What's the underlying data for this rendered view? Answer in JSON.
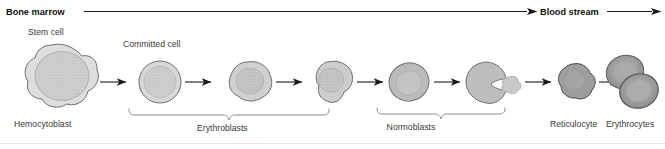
{
  "figure": {
    "title_hidden": "Erythropoiesis stages diagram",
    "header": {
      "left_label": "Bone marrow",
      "right_label": "Blood stream"
    },
    "callouts": {
      "stem_cell": "Stem cell",
      "committed_cell": "Committed cell"
    },
    "stage_labels": {
      "hemocytoblast": "Hemocytoblast",
      "erythroblasts": "Erythroblasts",
      "normoblasts": "Normoblasts",
      "reticulocyte": "Reticulocyte",
      "erythrocytes": "Erythrocytes"
    },
    "colors": {
      "cytoplasm_light": "#d9dadb",
      "nucleus_light": "#cfd1d2",
      "cytoplasm_mid": "#c6c8c9",
      "cytoplasm_dark": "#9b9d9e",
      "erythrocyte_fill": "#8e9091",
      "erythrocyte_center": "#a9abac",
      "outline": "#6f6f6f",
      "text": "#3a3a3a",
      "header_text": "#111111",
      "line": "#1a1a1a",
      "brace": "#8b8b8b"
    },
    "cells": [
      {
        "name": "hemocytoblast",
        "shape": "irregular-blob",
        "has_nucleus": true,
        "nucleus_style": "stippled-large"
      },
      {
        "name": "committed-cell",
        "shape": "round",
        "has_nucleus": true,
        "nucleus_style": "stippled"
      },
      {
        "name": "erythroblast-1",
        "shape": "rounded-irregular",
        "has_nucleus": true,
        "nucleus_style": "stippled"
      },
      {
        "name": "erythroblast-2",
        "shape": "lobed-irregular",
        "has_nucleus": true,
        "nucleus_style": "stippled"
      },
      {
        "name": "normoblast-1",
        "shape": "oval",
        "has_nucleus": true,
        "nucleus_style": "faint"
      },
      {
        "name": "normoblast-2-ejecting-nucleus",
        "shape": "c-shaped",
        "has_nucleus": true,
        "nucleus_style": "ejected-blob"
      },
      {
        "name": "reticulocyte",
        "shape": "irregular-round",
        "has_nucleus": false,
        "nucleus_style": "none"
      },
      {
        "name": "erythrocyte-pair",
        "shape": "two-overlapping-biconcave-discs",
        "has_nucleus": false,
        "nucleus_style": "none"
      }
    ],
    "arrow_count": 7
  }
}
